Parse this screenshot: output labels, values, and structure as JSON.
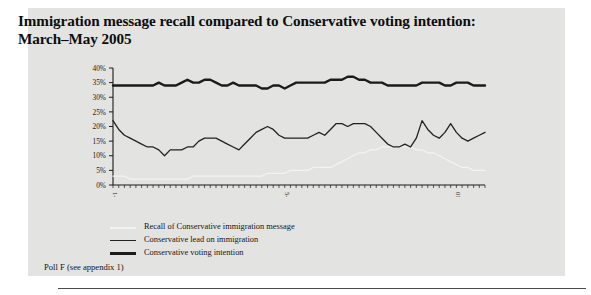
{
  "figure": {
    "title": "Immigration message recall compared to Conservative voting intention: March–May 2005",
    "source_note": "Poll F (see appendix 1)",
    "panel_color": "#e3e3e1"
  },
  "legend": {
    "position": "below-plot",
    "items": [
      {
        "label": "Recall of Conservative immigration message",
        "color": "#f3f3f1",
        "style": "thin-white",
        "swatch_name": "legend-swatch-recall"
      },
      {
        "label": "Conservative lead on immigration",
        "color": "#222222",
        "style": "thin-black",
        "swatch_name": "legend-swatch-lead"
      },
      {
        "label": "Conservative voting intention",
        "color": "#1b1b1b",
        "style": "thick-black",
        "swatch_name": "legend-swatch-voting-intention"
      }
    ]
  },
  "chart_data": {
    "type": "line",
    "title": "Immigration message recall compared to Conservative voting intention: March–May 2005",
    "xlabel": "",
    "ylabel": "",
    "ylim": [
      0,
      40
    ],
    "yticks": [
      0,
      5,
      10,
      15,
      20,
      25,
      30,
      35,
      40
    ],
    "ytick_labels": [
      "0%",
      "5%",
      "10%",
      "15%",
      "20%",
      "25%",
      "30%",
      "35%",
      "40%"
    ],
    "grid": false,
    "legend_position": "below",
    "xtick_labels": [
      "1-4 Mar",
      "5-6 Apr",
      "01-04 May"
    ],
    "xtick_positions": [
      0,
      30,
      60
    ],
    "x_count": 66,
    "series": [
      {
        "name": "Conservative voting intention",
        "color": "#1b1b1b",
        "width": 2.4,
        "values": [
          34,
          34,
          34,
          34,
          34,
          34,
          34,
          34,
          35,
          34,
          34,
          34,
          35,
          36,
          35,
          35,
          36,
          36,
          35,
          34,
          34,
          35,
          34,
          34,
          34,
          34,
          33,
          33,
          34,
          34,
          33,
          34,
          35,
          35,
          35,
          35,
          35,
          35,
          36,
          36,
          36,
          37,
          37,
          36,
          36,
          35,
          35,
          35,
          34,
          34,
          34,
          34,
          34,
          34,
          35,
          35,
          35,
          35,
          34,
          34,
          35,
          35,
          35,
          34,
          34,
          34
        ]
      },
      {
        "name": "Conservative lead on immigration",
        "color": "#222222",
        "width": 1.3,
        "values": [
          22,
          19,
          17,
          16,
          15,
          14,
          13,
          13,
          12,
          10,
          12,
          12,
          12,
          13,
          13,
          15,
          16,
          16,
          16,
          15,
          14,
          13,
          12,
          14,
          16,
          18,
          19,
          20,
          19,
          17,
          16,
          16,
          16,
          16,
          16,
          17,
          18,
          17,
          19,
          21,
          21,
          20,
          21,
          21,
          21,
          20,
          18,
          16,
          14,
          13,
          13,
          14,
          13,
          16,
          22,
          19,
          17,
          16,
          18,
          21,
          18,
          16,
          15,
          16,
          17,
          18
        ]
      },
      {
        "name": "Recall of Conservative immigration message",
        "color": "#f3f3f1",
        "width": 1.2,
        "values": [
          3,
          3,
          3,
          2,
          2,
          2,
          2,
          2,
          2,
          2,
          2,
          2,
          2,
          2,
          3,
          3,
          3,
          3,
          3,
          3,
          3,
          3,
          3,
          3,
          3,
          3,
          3,
          4,
          4,
          4,
          4,
          5,
          5,
          5,
          5,
          6,
          6,
          6,
          6,
          7,
          8,
          9,
          10,
          11,
          11,
          12,
          12,
          13,
          13,
          13,
          13,
          13,
          13,
          12,
          12,
          11,
          11,
          10,
          9,
          8,
          7,
          6,
          6,
          5,
          5,
          5
        ]
      }
    ]
  }
}
